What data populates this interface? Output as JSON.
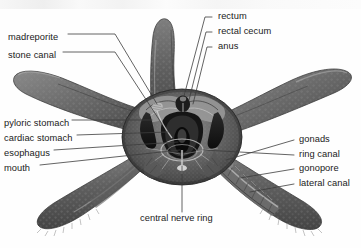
{
  "figure": {
    "view": "aboral dissection, five-rayed sea star",
    "background_color": "#ffffff",
    "leader_line_color": "#3c3c3c",
    "text_color": "#1a1a1a",
    "body_color_dark": "#4c4c4c",
    "body_color_mid": "#6e6e6e",
    "body_color_light": "#9a9a9a"
  },
  "labels": {
    "left": [
      {
        "text": "madreporite",
        "x": 8,
        "y": 32
      },
      {
        "text": "stone canal",
        "x": 8,
        "y": 50
      },
      {
        "text": "pyloric stomach",
        "x": 4,
        "y": 118
      },
      {
        "text": "cardiac stomach",
        "x": 4,
        "y": 133
      },
      {
        "text": "esophagus",
        "x": 4,
        "y": 148
      },
      {
        "text": "mouth",
        "x": 4,
        "y": 163
      }
    ],
    "top_right": [
      {
        "text": "rectum",
        "x": 218,
        "y": 15
      },
      {
        "text": "rectal cecum",
        "x": 218,
        "y": 30
      },
      {
        "text": "anus",
        "x": 218,
        "y": 45
      }
    ],
    "right": [
      {
        "text": "gonads",
        "x": 299,
        "y": 138
      },
      {
        "text": "ring canal",
        "x": 299,
        "y": 153
      },
      {
        "text": "gonopore",
        "x": 299,
        "y": 167
      },
      {
        "text": "lateral canal",
        "x": 299,
        "y": 182
      }
    ],
    "bottom": [
      {
        "text": "central nerve ring",
        "x": 140,
        "y": 217
      }
    ]
  }
}
